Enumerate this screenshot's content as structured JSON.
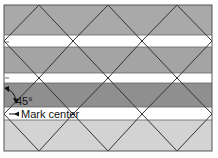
{
  "diagram": {
    "angle_label": "45°",
    "center_label": "Mark center",
    "frame": {
      "x": 4,
      "y": 5,
      "width": 208,
      "height": 146
    },
    "bands": [
      {
        "name": "band-top-gray",
        "y": 5,
        "height": 30,
        "color": "#a9a9a9"
      },
      {
        "name": "band-white-1",
        "y": 35,
        "height": 12,
        "color": "#ffffff"
      },
      {
        "name": "band-mid-gray",
        "y": 47,
        "height": 26,
        "color": "#a4a4a4"
      },
      {
        "name": "band-white-2",
        "y": 73,
        "height": 10,
        "color": "#ffffff"
      },
      {
        "name": "band-dark-gray",
        "y": 83,
        "height": 24,
        "color": "#8f8f8f"
      },
      {
        "name": "band-white-3",
        "y": 107,
        "height": 13,
        "color": "#ffffff"
      },
      {
        "name": "band-light-gray",
        "y": 120,
        "height": 31,
        "color": "#d3d3d3"
      }
    ],
    "colors": {
      "line": "#333333",
      "frame": "#555555",
      "text": "#111111"
    }
  }
}
